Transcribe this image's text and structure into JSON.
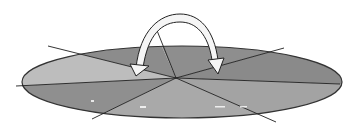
{
  "diagram": {
    "center": {
      "x": 176,
      "y": 78
    },
    "ellipse": {
      "cx": 182,
      "cy": 82,
      "rx": 160,
      "ry": 36
    },
    "colors": {
      "background": "#ffffff",
      "light_sector": "#b8b8b8",
      "dark_sector": "#8a8a8a",
      "mid_sector": "#a0a0a0",
      "outline": "#222222",
      "arrow_fill": "#f4f4f4"
    },
    "lines": [
      {
        "x1": 48,
        "y1": 46,
        "x2": 176,
        "y2": 78
      },
      {
        "x1": 16,
        "y1": 86,
        "x2": 176,
        "y2": 78
      },
      {
        "x1": 92,
        "y1": 119,
        "x2": 176,
        "y2": 78
      },
      {
        "x1": 176,
        "y1": 78,
        "x2": 156,
        "y2": 28
      },
      {
        "x1": 176,
        "y1": 78,
        "x2": 284,
        "y2": 48
      },
      {
        "x1": 176,
        "y1": 78,
        "x2": 340,
        "y2": 84
      },
      {
        "x1": 176,
        "y1": 78,
        "x2": 276,
        "y2": 122
      }
    ],
    "arrow": {
      "start": {
        "x": 133,
        "y": 72
      },
      "peak": {
        "x": 178,
        "y": 12
      },
      "end": {
        "x": 220,
        "y": 72
      }
    }
  }
}
